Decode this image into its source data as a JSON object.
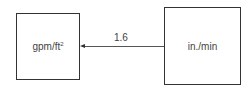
{
  "diagram": {
    "left_box": {
      "label": "gpm/ft",
      "superscript": "2"
    },
    "right_box": {
      "label": "in./min"
    },
    "arrow": {
      "from": "right_box",
      "to": "left_box",
      "label": "1.6"
    }
  }
}
